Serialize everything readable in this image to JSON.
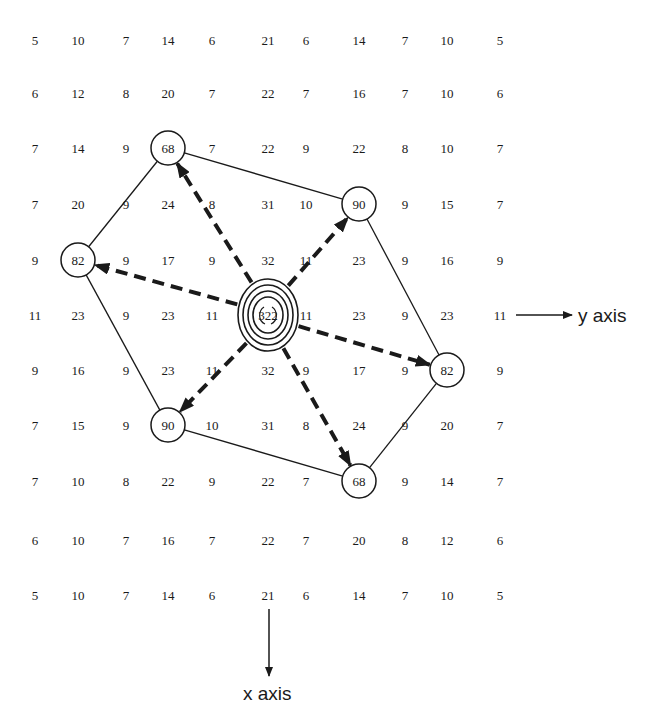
{
  "diagram": {
    "columns_x": [
      35,
      78,
      126,
      168,
      212,
      268,
      306,
      359,
      405,
      447,
      500
    ],
    "rows_y": [
      40,
      93,
      148,
      204,
      260,
      315,
      370,
      425,
      481,
      540,
      595
    ],
    "grid": [
      [
        "5",
        "10",
        "7",
        "14",
        "6",
        "21",
        "6",
        "14",
        "7",
        "10",
        "5"
      ],
      [
        "6",
        "12",
        "8",
        "20",
        "7",
        "22",
        "7",
        "16",
        "7",
        "10",
        "6"
      ],
      [
        "7",
        "14",
        "9",
        "68",
        "7",
        "22",
        "9",
        "22",
        "8",
        "10",
        "7"
      ],
      [
        "7",
        "20",
        "9",
        "24",
        "8",
        "31",
        "10",
        "90",
        "9",
        "15",
        "7"
      ],
      [
        "9",
        "82",
        "9",
        "17",
        "9",
        "32",
        "11",
        "23",
        "9",
        "16",
        "9"
      ],
      [
        "11",
        "23",
        "9",
        "23",
        "11",
        "322",
        "11",
        "23",
        "9",
        "23",
        "11"
      ],
      [
        "9",
        "16",
        "9",
        "23",
        "11",
        "32",
        "9",
        "17",
        "9",
        "82",
        "9"
      ],
      [
        "7",
        "15",
        "9",
        "90",
        "10",
        "31",
        "8",
        "24",
        "9",
        "20",
        "7"
      ],
      [
        "7",
        "10",
        "8",
        "22",
        "9",
        "22",
        "7",
        "68",
        "9",
        "14",
        "7"
      ],
      [
        "6",
        "10",
        "7",
        "16",
        "7",
        "22",
        "7",
        "20",
        "8",
        "12",
        "6"
      ],
      [
        "5",
        "10",
        "7",
        "14",
        "6",
        "21",
        "6",
        "14",
        "7",
        "10",
        "5"
      ]
    ],
    "center_peak": {
      "value": "322",
      "row": 5,
      "col": 5
    },
    "circled_peaks": [
      {
        "value": "68",
        "row": 2,
        "col": 3
      },
      {
        "value": "90",
        "row": 3,
        "col": 7
      },
      {
        "value": "82",
        "row": 4,
        "col": 1
      },
      {
        "value": "82",
        "row": 6,
        "col": 9
      },
      {
        "value": "90",
        "row": 7,
        "col": 3
      },
      {
        "value": "68",
        "row": 8,
        "col": 7
      }
    ],
    "hexagon_order": [
      "68 (2,3)",
      "90 (3,7)",
      "82 (6,9)",
      "68 (8,7)",
      "90 (7,3)",
      "82 (4,1)"
    ],
    "axes": {
      "y_label": "y axis",
      "x_label": "x axis"
    },
    "colors": {
      "ink": "#1a1a1a",
      "background": "#ffffff"
    }
  }
}
